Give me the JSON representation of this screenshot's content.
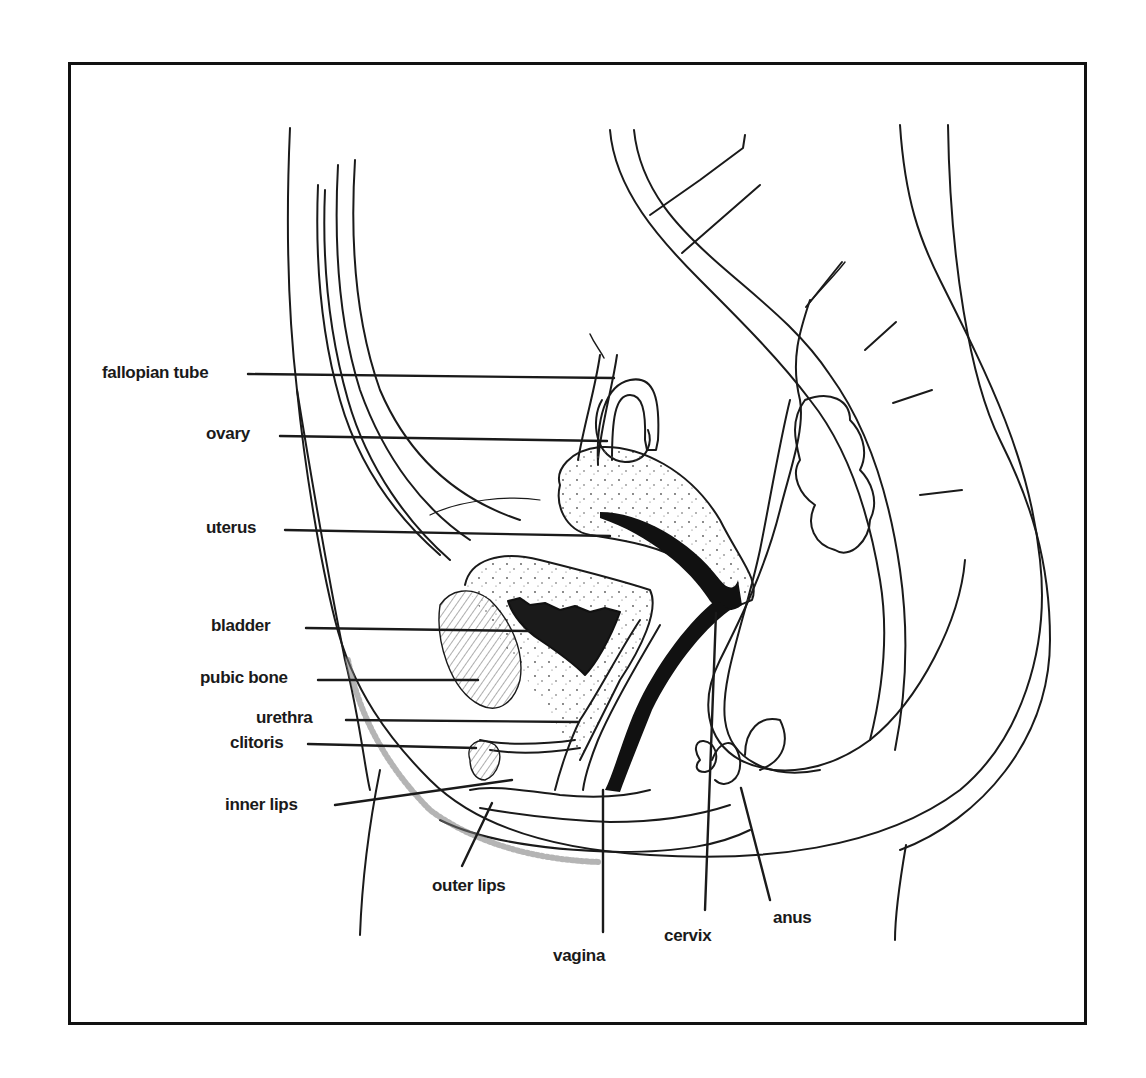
{
  "diagram": {
    "type": "anatomical cross-section (sagittal view)",
    "colors": {
      "background": "#ffffff",
      "frame": "#111111",
      "line": "#1a1a1a",
      "stipple": "#555555",
      "label": "#1a1a1a"
    },
    "labels": [
      {
        "id": "fallopian-tube",
        "text": "fallopian tube"
      },
      {
        "id": "ovary",
        "text": "ovary"
      },
      {
        "id": "uterus",
        "text": "uterus"
      },
      {
        "id": "bladder",
        "text": "bladder"
      },
      {
        "id": "pubic-bone",
        "text": "pubic bone"
      },
      {
        "id": "urethra",
        "text": "urethra"
      },
      {
        "id": "clitoris",
        "text": "clitoris"
      },
      {
        "id": "inner-lips",
        "text": "inner lips"
      },
      {
        "id": "outer-lips",
        "text": "outer lips"
      },
      {
        "id": "vagina",
        "text": "vagina"
      },
      {
        "id": "cervix",
        "text": "cervix"
      },
      {
        "id": "anus",
        "text": "anus"
      }
    ]
  }
}
